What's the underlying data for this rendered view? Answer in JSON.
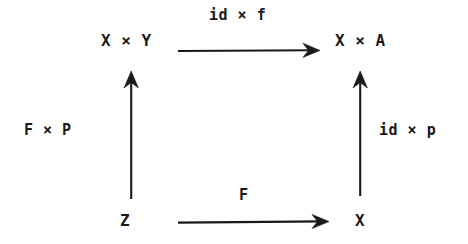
{
  "diagram": {
    "kind": "commutative-diagram",
    "shape": "square",
    "ink_color": "#1a1a1a",
    "background_color": "#ffffff",
    "objects": {
      "top_left": "X × Y",
      "top_right": "X × A",
      "bottom_left": "Z",
      "bottom_right": "X"
    },
    "morphisms": {
      "top": "id × f",
      "left": "F × P",
      "right": "id × p",
      "bottom": "F"
    },
    "arrows": [
      {
        "name": "top-arrow",
        "from": "top_left",
        "to": "top_right",
        "direction": "right",
        "label": "id × f",
        "x1": 178,
        "y1": 51,
        "x2": 320,
        "y2": 51
      },
      {
        "name": "left-arrow",
        "from": "bottom_left",
        "to": "top_left",
        "direction": "up",
        "label": "F × P",
        "x1": 131,
        "y1": 199,
        "x2": 131,
        "y2": 71
      },
      {
        "name": "right-arrow",
        "from": "bottom_right",
        "to": "top_right",
        "direction": "up",
        "label": "id × p",
        "x1": 360,
        "y1": 196,
        "x2": 360,
        "y2": 71
      },
      {
        "name": "bottom-arrow",
        "from": "bottom_left",
        "to": "bottom_right",
        "direction": "right",
        "label": "F",
        "x1": 178,
        "y1": 222,
        "x2": 329,
        "y2": 222
      }
    ]
  }
}
